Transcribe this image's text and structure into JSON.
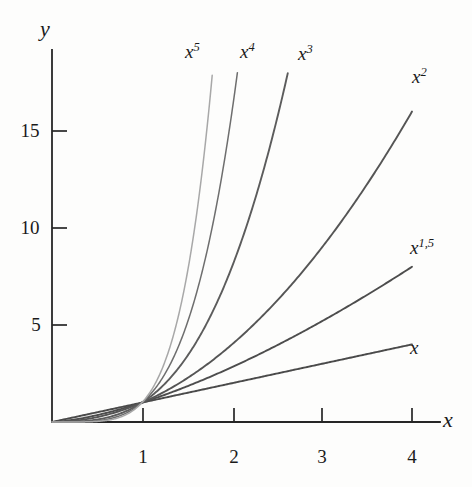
{
  "chart_data": {
    "type": "line",
    "title": "",
    "subtitle": "",
    "xlabel": "x",
    "ylabel": "y",
    "xlim": [
      0,
      4.35
    ],
    "ylim": [
      0,
      18.6
    ],
    "xticks": [
      1,
      2,
      3,
      4
    ],
    "xtick_labels": [
      "1",
      "2",
      "3",
      "4"
    ],
    "yticks": [
      5,
      10,
      15
    ],
    "ytick_labels": [
      "5",
      "10",
      "15"
    ],
    "grid": false,
    "legend": "inline-curve-labels",
    "series": [
      {
        "name": "x",
        "label": "x",
        "exponent": 1,
        "color": "#4a4a4a",
        "x": [
          0,
          0.5,
          1,
          1.5,
          2,
          2.5,
          3,
          3.5,
          4
        ],
        "values": [
          0,
          0.5,
          1,
          1.5,
          2,
          2.5,
          3,
          3.5,
          4
        ],
        "end_point": [
          4,
          4
        ]
      },
      {
        "name": "x^1,5",
        "label": "x",
        "label_sup": "1,5",
        "exponent": 1.5,
        "color": "#4d4d4d",
        "x": [
          0,
          0.5,
          1,
          1.5,
          2,
          2.5,
          3,
          3.5,
          4
        ],
        "values": [
          0,
          0.35,
          1,
          1.84,
          2.83,
          3.95,
          5.2,
          6.55,
          8
        ],
        "end_point": [
          4,
          8
        ]
      },
      {
        "name": "x^2",
        "label": "x",
        "label_sup": "2",
        "exponent": 2,
        "color": "#555555",
        "x": [
          0,
          0.5,
          1,
          1.5,
          2,
          2.5,
          3,
          3.5,
          4
        ],
        "values": [
          0,
          0.25,
          1,
          2.25,
          4,
          6.25,
          9,
          12.25,
          16
        ],
        "end_point": [
          4,
          16
        ]
      },
      {
        "name": "x^3",
        "label": "x",
        "label_sup": "3",
        "exponent": 3,
        "color": "#5c5c5c",
        "x": [
          0,
          0.5,
          1,
          1.5,
          2,
          2.5,
          2.62
        ],
        "values": [
          0,
          0.125,
          1,
          3.375,
          8,
          15.63,
          18
        ],
        "end_point": [
          2.62,
          18
        ]
      },
      {
        "name": "x^4",
        "label": "x",
        "label_sup": "4",
        "exponent": 4,
        "color": "#6e6e6e",
        "x": [
          0,
          0.5,
          1,
          1.5,
          1.8,
          2.06
        ],
        "values": [
          0,
          0.0625,
          1,
          5.06,
          10.5,
          18
        ],
        "end_point": [
          2.06,
          18
        ]
      },
      {
        "name": "x^5",
        "label": "x",
        "label_sup": "5",
        "exponent": 5,
        "color": "#a8a8a8",
        "x": [
          0,
          0.5,
          1,
          1.3,
          1.6,
          1.78
        ],
        "values": [
          0,
          0.031,
          1,
          3.71,
          10.49,
          18
        ],
        "end_point": [
          1.78,
          18
        ]
      }
    ]
  },
  "axes": {
    "y_axis_label": "y",
    "x_axis_label": "x",
    "y_tick_labels": [
      "15",
      "10",
      "5"
    ],
    "x_tick_labels": [
      "1",
      "2",
      "3",
      "4"
    ]
  },
  "curve_labels": {
    "x5": {
      "base": "x",
      "sup": "5"
    },
    "x4": {
      "base": "x",
      "sup": "4"
    },
    "x3": {
      "base": "x",
      "sup": "3"
    },
    "x2": {
      "base": "x",
      "sup": "2"
    },
    "x15": {
      "base": "x",
      "sup": "1,5"
    },
    "x1": {
      "base": "x",
      "sup": ""
    }
  },
  "colors": {
    "background": "#fdfdfc",
    "axis": "#262626",
    "text": "#1a1a1a"
  }
}
